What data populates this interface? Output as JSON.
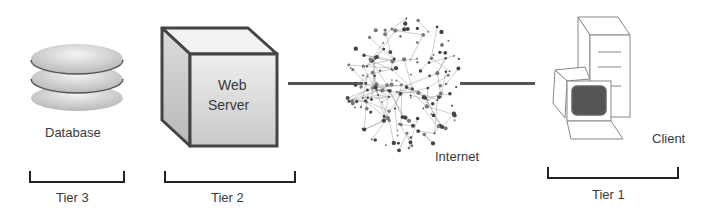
{
  "diagram": {
    "type": "three-tier-architecture",
    "nodes": [
      {
        "id": "database",
        "label": "Database",
        "icon": "database-stack-icon"
      },
      {
        "id": "web-server",
        "label_line1": "Web",
        "label_line2": "Server",
        "icon": "server-cube-icon"
      },
      {
        "id": "internet",
        "label": "Internet",
        "icon": "network-cloud-icon"
      },
      {
        "id": "client",
        "label": "Client",
        "icon": "desktop-computer-icon"
      }
    ],
    "edges": [
      {
        "from": "web-server",
        "to": "internet"
      },
      {
        "from": "internet",
        "to": "client"
      }
    ],
    "tiers": [
      {
        "label": "Tier 3",
        "spans": [
          "database"
        ]
      },
      {
        "label": "Tier 2",
        "spans": [
          "web-server"
        ]
      },
      {
        "label": "Tier 1",
        "spans": [
          "client"
        ]
      }
    ],
    "colors": {
      "line": "#555555",
      "bracket": "#222222",
      "screen": "#555555",
      "outline": "#444444"
    }
  }
}
